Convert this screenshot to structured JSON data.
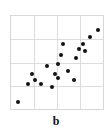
{
  "panel": {
    "label": "b"
  },
  "style": {
    "point_color": "#111111",
    "grid_color": "#dcdcdc",
    "frame_color": "#d8d8d8",
    "background": "#ffffff"
  },
  "chart_data": {
    "type": "scatter",
    "title": "",
    "subtitle": "",
    "xlabel": "",
    "ylabel": "",
    "annotations": [
      "b"
    ],
    "legend": [],
    "legend_position": "none",
    "grid": true,
    "grid_columns": 4,
    "grid_rows": 4,
    "xlim": [
      0,
      100
    ],
    "ylim": [
      0,
      100
    ],
    "xticks": [
      0,
      25,
      50,
      75,
      100
    ],
    "yticks": [
      0,
      25,
      50,
      75,
      100
    ],
    "xtick_labels": [],
    "ytick_labels": [],
    "series": [
      {
        "name": "",
        "marker": "filled-circle",
        "points": [
          {
            "x": 8,
            "y": 8
          },
          {
            "x": 18,
            "y": 27
          },
          {
            "x": 26,
            "y": 31
          },
          {
            "x": 23,
            "y": 38
          },
          {
            "x": 33,
            "y": 27
          },
          {
            "x": 39,
            "y": 46
          },
          {
            "x": 48,
            "y": 38
          },
          {
            "x": 51,
            "y": 33
          },
          {
            "x": 45,
            "y": 24
          },
          {
            "x": 51,
            "y": 48
          },
          {
            "x": 54,
            "y": 58
          },
          {
            "x": 62,
            "y": 41
          },
          {
            "x": 57,
            "y": 70
          },
          {
            "x": 68,
            "y": 31
          },
          {
            "x": 71,
            "y": 55
          },
          {
            "x": 74,
            "y": 64
          },
          {
            "x": 78,
            "y": 70
          },
          {
            "x": 80,
            "y": 62
          },
          {
            "x": 86,
            "y": 77
          },
          {
            "x": 95,
            "y": 85
          }
        ]
      }
    ]
  }
}
